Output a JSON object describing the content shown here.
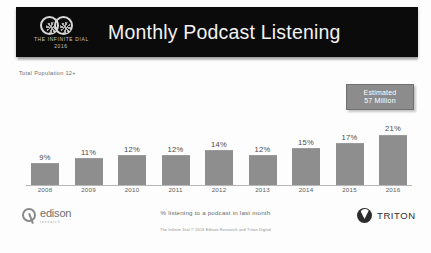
{
  "header": {
    "title": "Monthly Podcast Listening",
    "logo_line1": "THE INFINITE DIAL",
    "logo_line2": "2016"
  },
  "base_label": "Total Population  12+",
  "callout": {
    "line1": "Estimated",
    "line2": "57 Million"
  },
  "caption": "% listening to a podcast in last month",
  "source_note": "The Infinite Dial  © 2016 Edison Research and Triton Digital",
  "footer": {
    "edison_name": "edison",
    "edison_sub": "research",
    "triton_name": "TRITON"
  },
  "chart_data": {
    "type": "bar",
    "title": "Monthly Podcast Listening",
    "xlabel": "",
    "ylabel": "",
    "ylim": [
      0,
      25
    ],
    "grid": false,
    "legend": "none",
    "categories": [
      "2008",
      "2009",
      "2010",
      "2011",
      "2012",
      "2013",
      "2014",
      "2015",
      "2016"
    ],
    "values": [
      9,
      11,
      12,
      12,
      14,
      12,
      15,
      17,
      21
    ],
    "value_labels": [
      "9%",
      "11%",
      "12%",
      "12%",
      "14%",
      "12%",
      "15%",
      "17%",
      "21%"
    ],
    "bar_color": "#8e8e8e",
    "annotations": [
      "Estimated 57 Million"
    ]
  }
}
